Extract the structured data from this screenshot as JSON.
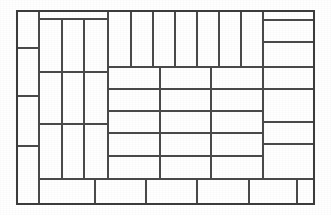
{
  "figure": {
    "kind": "line-drawing",
    "width": 331,
    "height": 215,
    "background_color": "#ffffff",
    "line_color": "#4a4a4a",
    "frame_color": "#3c3c3c",
    "fill_color": "#ffffff"
  },
  "outer_frame": {
    "x": 17,
    "y": 11,
    "width": 297,
    "height": 193
  },
  "regions": [
    {
      "name": "left-column",
      "description": "Narrow vertical strip along the left edge split into four stacked cells",
      "cell_count": 4
    },
    {
      "name": "inner-left-block",
      "description": "Three tall vertical columns split into three horizontal bands",
      "cell_count": 9
    },
    {
      "name": "top-strip",
      "description": "Row of seven narrow vertical tiles across the top",
      "cell_count": 7
    },
    {
      "name": "center-grid",
      "description": "Three column by five row grid in the centre",
      "cell_count": 15
    },
    {
      "name": "right-column",
      "description": "Wide vertical strip along the right edge split into seven horizontal bands",
      "cell_count": 7
    },
    {
      "name": "bottom-strip",
      "description": "Row of six tiles along the bottom edge",
      "cell_count": 6
    }
  ],
  "cells": [
    {
      "id": "L1",
      "region": "left-column",
      "x": 17,
      "y": 11,
      "w": 22,
      "h": 37
    },
    {
      "id": "L2",
      "region": "left-column",
      "x": 17,
      "y": 48,
      "w": 22,
      "h": 48
    },
    {
      "id": "L3",
      "region": "left-column",
      "x": 17,
      "y": 96,
      "w": 22,
      "h": 50
    },
    {
      "id": "L4",
      "region": "left-column",
      "x": 17,
      "y": 146,
      "w": 22,
      "h": 58
    },
    {
      "id": "B1",
      "region": "inner-left-block",
      "x": 39,
      "y": 19,
      "w": 23,
      "h": 53
    },
    {
      "id": "B2",
      "region": "inner-left-block",
      "x": 62,
      "y": 19,
      "w": 22,
      "h": 53
    },
    {
      "id": "B3",
      "region": "inner-left-block",
      "x": 84,
      "y": 19,
      "w": 24,
      "h": 53
    },
    {
      "id": "B4",
      "region": "inner-left-block",
      "x": 39,
      "y": 72,
      "w": 23,
      "h": 52
    },
    {
      "id": "B5",
      "region": "inner-left-block",
      "x": 62,
      "y": 72,
      "w": 22,
      "h": 52
    },
    {
      "id": "B6",
      "region": "inner-left-block",
      "x": 84,
      "y": 72,
      "w": 24,
      "h": 52
    },
    {
      "id": "B7",
      "region": "inner-left-block",
      "x": 39,
      "y": 124,
      "w": 23,
      "h": 55
    },
    {
      "id": "B8",
      "region": "inner-left-block",
      "x": 62,
      "y": 124,
      "w": 22,
      "h": 55
    },
    {
      "id": "B9",
      "region": "inner-left-block",
      "x": 84,
      "y": 124,
      "w": 24,
      "h": 55
    },
    {
      "id": "T1",
      "region": "top-strip",
      "x": 108,
      "y": 11,
      "w": 23,
      "h": 56
    },
    {
      "id": "T2",
      "region": "top-strip",
      "x": 131,
      "y": 11,
      "w": 22,
      "h": 56
    },
    {
      "id": "T3",
      "region": "top-strip",
      "x": 153,
      "y": 11,
      "w": 22,
      "h": 56
    },
    {
      "id": "T4",
      "region": "top-strip",
      "x": 175,
      "y": 11,
      "w": 22,
      "h": 56
    },
    {
      "id": "T5",
      "region": "top-strip",
      "x": 197,
      "y": 11,
      "w": 22,
      "h": 56
    },
    {
      "id": "T6",
      "region": "top-strip",
      "x": 219,
      "y": 11,
      "w": 22,
      "h": 56
    },
    {
      "id": "T7",
      "region": "top-strip",
      "x": 241,
      "y": 11,
      "w": 22,
      "h": 56
    },
    {
      "id": "C11",
      "region": "center-grid",
      "x": 108,
      "y": 67,
      "w": 52,
      "h": 22
    },
    {
      "id": "C12",
      "region": "center-grid",
      "x": 160,
      "y": 67,
      "w": 51,
      "h": 22
    },
    {
      "id": "C13",
      "region": "center-grid",
      "x": 211,
      "y": 67,
      "w": 52,
      "h": 22
    },
    {
      "id": "C21",
      "region": "center-grid",
      "x": 108,
      "y": 89,
      "w": 52,
      "h": 22
    },
    {
      "id": "C22",
      "region": "center-grid",
      "x": 160,
      "y": 89,
      "w": 51,
      "h": 22
    },
    {
      "id": "C23",
      "region": "center-grid",
      "x": 211,
      "y": 89,
      "w": 52,
      "h": 22
    },
    {
      "id": "C31",
      "region": "center-grid",
      "x": 108,
      "y": 111,
      "w": 52,
      "h": 22
    },
    {
      "id": "C32",
      "region": "center-grid",
      "x": 160,
      "y": 111,
      "w": 51,
      "h": 22
    },
    {
      "id": "C33",
      "region": "center-grid",
      "x": 211,
      "y": 111,
      "w": 52,
      "h": 22
    },
    {
      "id": "C41",
      "region": "center-grid",
      "x": 108,
      "y": 133,
      "w": 52,
      "h": 23
    },
    {
      "id": "C42",
      "region": "center-grid",
      "x": 160,
      "y": 133,
      "w": 51,
      "h": 23
    },
    {
      "id": "C43",
      "region": "center-grid",
      "x": 211,
      "y": 133,
      "w": 52,
      "h": 23
    },
    {
      "id": "C51",
      "region": "center-grid",
      "x": 108,
      "y": 156,
      "w": 52,
      "h": 23
    },
    {
      "id": "C52",
      "region": "center-grid",
      "x": 160,
      "y": 156,
      "w": 51,
      "h": 23
    },
    {
      "id": "C53",
      "region": "center-grid",
      "x": 211,
      "y": 156,
      "w": 52,
      "h": 23
    },
    {
      "id": "R1",
      "region": "right-column",
      "x": 263,
      "y": 11,
      "w": 51,
      "h": 9
    },
    {
      "id": "R2",
      "region": "right-column",
      "x": 263,
      "y": 20,
      "w": 51,
      "h": 22
    },
    {
      "id": "R3",
      "region": "right-column",
      "x": 263,
      "y": 42,
      "w": 51,
      "h": 25
    },
    {
      "id": "R4",
      "region": "right-column",
      "x": 263,
      "y": 67,
      "w": 51,
      "h": 22
    },
    {
      "id": "R5",
      "region": "right-column",
      "x": 263,
      "y": 89,
      "w": 51,
      "h": 33
    },
    {
      "id": "R6",
      "region": "right-column",
      "x": 263,
      "y": 122,
      "w": 51,
      "h": 22
    },
    {
      "id": "R7",
      "region": "right-column",
      "x": 263,
      "y": 144,
      "w": 51,
      "h": 35
    },
    {
      "id": "F1",
      "region": "bottom-strip",
      "x": 39,
      "y": 179,
      "w": 56,
      "h": 25
    },
    {
      "id": "F2",
      "region": "bottom-strip",
      "x": 95,
      "y": 179,
      "w": 51,
      "h": 25
    },
    {
      "id": "F3",
      "region": "bottom-strip",
      "x": 146,
      "y": 179,
      "w": 51,
      "h": 25
    },
    {
      "id": "F4",
      "region": "bottom-strip",
      "x": 197,
      "y": 179,
      "w": 52,
      "h": 25
    },
    {
      "id": "F5",
      "region": "bottom-strip",
      "x": 249,
      "y": 179,
      "w": 48,
      "h": 25
    },
    {
      "id": "F6",
      "region": "bottom-strip",
      "x": 297,
      "y": 179,
      "w": 17,
      "h": 25
    }
  ]
}
